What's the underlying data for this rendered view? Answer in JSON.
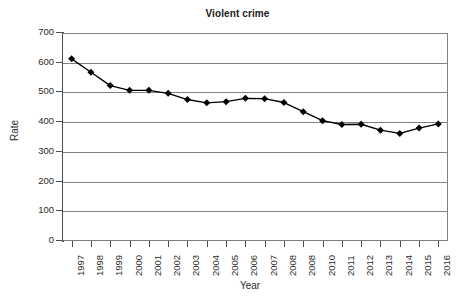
{
  "chart_data": {
    "type": "line",
    "title": "Violent crime",
    "xlabel": "Year",
    "ylabel": "Rate",
    "grid": true,
    "legend": false,
    "marker": "diamond",
    "marker_color": "#000000",
    "line_color": "#000000",
    "ylim": [
      0,
      700
    ],
    "yticks": [
      0,
      100,
      200,
      300,
      400,
      500,
      600,
      700
    ],
    "ytick_labels": [
      "0",
      "100",
      "200",
      "300",
      "400",
      "500",
      "600",
      "700"
    ],
    "categories": [
      "1997",
      "1998",
      "1999",
      "2000",
      "2001",
      "2002",
      "2003",
      "2004",
      "2005",
      "2006",
      "2007",
      "2008",
      "2008",
      "2010",
      "2011",
      "2012",
      "2013",
      "2014",
      "2015",
      "2016"
    ],
    "values": [
      613,
      568,
      523,
      507,
      507,
      497,
      476,
      465,
      469,
      480,
      479,
      466,
      435,
      405,
      392,
      393,
      373,
      362,
      380,
      394
    ],
    "series": [
      {
        "name": "Violent crime rate",
        "values": [
          613,
          568,
          523,
          507,
          507,
          497,
          476,
          465,
          469,
          480,
          479,
          466,
          435,
          405,
          392,
          393,
          373,
          362,
          380,
          394
        ]
      }
    ]
  }
}
